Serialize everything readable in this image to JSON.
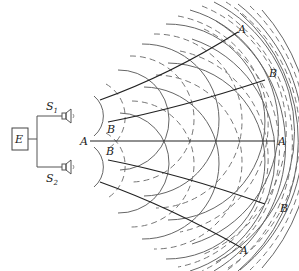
{
  "diagram": {
    "source_box_label": "E",
    "speakers": [
      {
        "label": "S",
        "subscript": "1"
      },
      {
        "label": "S",
        "subscript": "2"
      }
    ],
    "line_labels": {
      "antinode_center_left": "A",
      "antinode_center_right": "A",
      "antinode_top": "A",
      "antinode_bottom": "A",
      "node_top_right": "B",
      "node_bottom_right": "B",
      "node_top_left": "B",
      "node_bottom_left": "B"
    },
    "colors": {
      "wavefront": "#666666",
      "lines": "#222222",
      "background": "#ffffff"
    }
  }
}
